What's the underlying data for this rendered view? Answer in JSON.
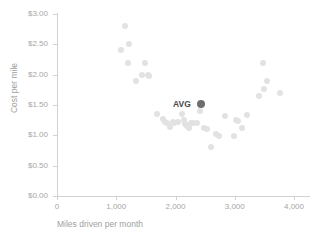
{
  "chart_data": {
    "type": "scatter",
    "title": "",
    "xlabel": "Miles driven per month",
    "ylabel": "Cost per mile",
    "xlim": [
      0,
      4000
    ],
    "ylim": [
      0,
      3.0
    ],
    "grid": false,
    "legend": null,
    "xticks": [
      {
        "value": 0,
        "label": "0"
      },
      {
        "value": 1000,
        "label": "1,000"
      },
      {
        "value": 2000,
        "label": "2,000"
      },
      {
        "value": 3000,
        "label": "3,000"
      },
      {
        "value": 4000,
        "label": "4,000"
      }
    ],
    "yticks": [
      {
        "value": 3.0,
        "label": "$3.00"
      },
      {
        "value": 2.5,
        "label": "$2.50"
      },
      {
        "value": 2.0,
        "label": "$2.00"
      },
      {
        "value": 1.5,
        "label": "$1.50"
      },
      {
        "value": 1.0,
        "label": "$1.00"
      },
      {
        "value": 0.5,
        "label": "$0.50"
      },
      {
        "value": 0.0,
        "label": "$0.00"
      }
    ],
    "series": [
      {
        "name": "vehicles",
        "color": "#e2e2e2",
        "points": [
          [
            1150,
            2.8
          ],
          [
            1080,
            2.4
          ],
          [
            1210,
            2.5
          ],
          [
            1190,
            2.2
          ],
          [
            1340,
            1.9
          ],
          [
            1430,
            2.0
          ],
          [
            1480,
            2.2
          ],
          [
            1530,
            2.0
          ],
          [
            1560,
            1.98
          ],
          [
            1680,
            1.35
          ],
          [
            1790,
            1.27
          ],
          [
            1820,
            1.22
          ],
          [
            1850,
            1.2
          ],
          [
            1900,
            1.13
          ],
          [
            1960,
            1.22
          ],
          [
            1980,
            1.2
          ],
          [
            2040,
            1.22
          ],
          [
            2110,
            1.35
          ],
          [
            2140,
            1.25
          ],
          [
            2160,
            1.18
          ],
          [
            2200,
            1.16
          ],
          [
            2230,
            1.12
          ],
          [
            2260,
            1.21
          ],
          [
            2300,
            1.2
          ],
          [
            2370,
            1.2
          ],
          [
            2420,
            1.4
          ],
          [
            2480,
            1.12
          ],
          [
            2540,
            1.1
          ],
          [
            2600,
            0.8
          ],
          [
            2680,
            1.02
          ],
          [
            2730,
            0.99
          ],
          [
            2840,
            1.32
          ],
          [
            2990,
            0.99
          ],
          [
            3020,
            1.26
          ],
          [
            3060,
            1.24
          ],
          [
            3130,
            1.12
          ],
          [
            3200,
            1.34
          ],
          [
            3410,
            1.65
          ],
          [
            3470,
            2.2
          ],
          [
            3500,
            1.77
          ],
          [
            3540,
            1.9
          ],
          [
            3760,
            1.7
          ]
        ]
      }
    ],
    "annotations": [
      {
        "name": "AVG",
        "label": "AVG",
        "x": 2430,
        "y": 1.52,
        "color": "#6e6e6e",
        "label_color": "#4a4a4a"
      }
    ]
  }
}
